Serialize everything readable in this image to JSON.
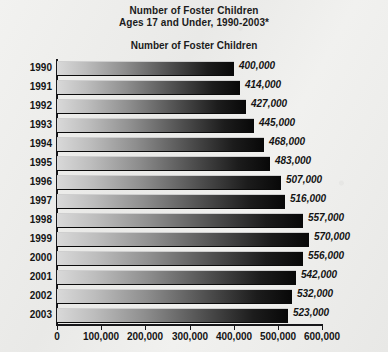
{
  "title": {
    "line1": "Number of Foster Children",
    "line2": "Ages 17 and Under, 1990-2003*"
  },
  "axis_title": "Number of Foster Children",
  "chart_data": {
    "type": "bar",
    "orientation": "horizontal",
    "title": "Number of Foster Children Ages 17 and Under, 1990-2003*",
    "xlabel": "Number of Foster Children",
    "ylabel": "",
    "categories": [
      "1990",
      "1991",
      "1992",
      "1993",
      "1994",
      "1995",
      "1996",
      "1997",
      "1998",
      "1999",
      "2000",
      "2001",
      "2002",
      "2003"
    ],
    "values": [
      400000,
      414000,
      427000,
      445000,
      468000,
      483000,
      507000,
      516000,
      557000,
      570000,
      556000,
      542000,
      532000,
      523000
    ],
    "value_labels": [
      "400,000",
      "414,000",
      "427,000",
      "445,000",
      "468,000",
      "483,000",
      "507,000",
      "516,000",
      "557,000",
      "570,000",
      "556,000",
      "542,000",
      "532,000",
      "523,000"
    ],
    "xlim": [
      0,
      600000
    ],
    "xticks": [
      0,
      100000,
      200000,
      300000,
      400000,
      500000,
      600000
    ],
    "xtick_labels": [
      "0",
      "100,000",
      "200,000",
      "300,000",
      "400,000",
      "500,000",
      "600,000"
    ],
    "grid": false,
    "legend": "none",
    "bar_fill": "gradient light-gray to black",
    "colors": {
      "bar_start": "#d9d9d9",
      "bar_end": "#080808",
      "axis": "#17171a",
      "background": "#eeeeec",
      "text": "#141414"
    }
  }
}
